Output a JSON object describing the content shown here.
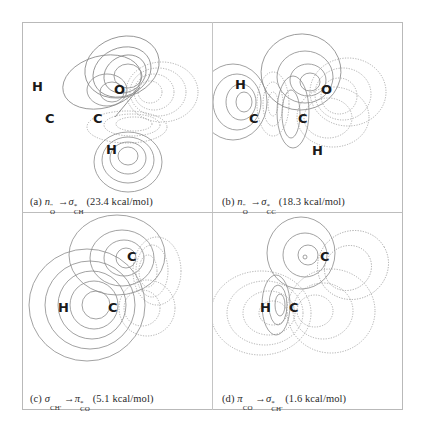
{
  "page_header": "",
  "panels": [
    {
      "id": "a",
      "label": "(a)",
      "donor": "n",
      "donor_sub": "O",
      "donor_sup": "\"",
      "arrow": "→",
      "acceptor": "σ",
      "acceptor_sup": "*",
      "acceptor_sub": "CH",
      "energy": "(23.4 kcal/mol)",
      "atoms": [
        "H",
        "C",
        "C",
        "O",
        "H"
      ]
    },
    {
      "id": "b",
      "label": "(b)",
      "donor": "n",
      "donor_sub": "O",
      "donor_sup": "\"",
      "arrow": "→",
      "acceptor": "σ",
      "acceptor_sup": "*",
      "acceptor_sub": "CC",
      "energy": "(18.3 kcal/mol)",
      "atoms": [
        "H",
        "C",
        "C",
        "O",
        "H"
      ]
    },
    {
      "id": "c",
      "label": "(c)",
      "donor": "σ",
      "donor_sub": "CH'",
      "donor_sup": "",
      "arrow": "→",
      "acceptor": "π",
      "acceptor_sup": "*",
      "acceptor_sub": "CO",
      "energy": "(5.1 kcal/mol)",
      "atoms": [
        "H",
        "C",
        "C"
      ]
    },
    {
      "id": "d",
      "label": "(d)",
      "donor": "π",
      "donor_sub": "CO",
      "donor_sup": "",
      "arrow": "→",
      "acceptor": "σ",
      "acceptor_sup": "*",
      "acceptor_sub": "CH'",
      "energy": "(1.6 kcal/mol)",
      "atoms": [
        "H",
        "C",
        "C"
      ]
    }
  ],
  "legend": {
    "solid_lines": "positive phase contours",
    "dotted_lines": "negative phase contours"
  }
}
